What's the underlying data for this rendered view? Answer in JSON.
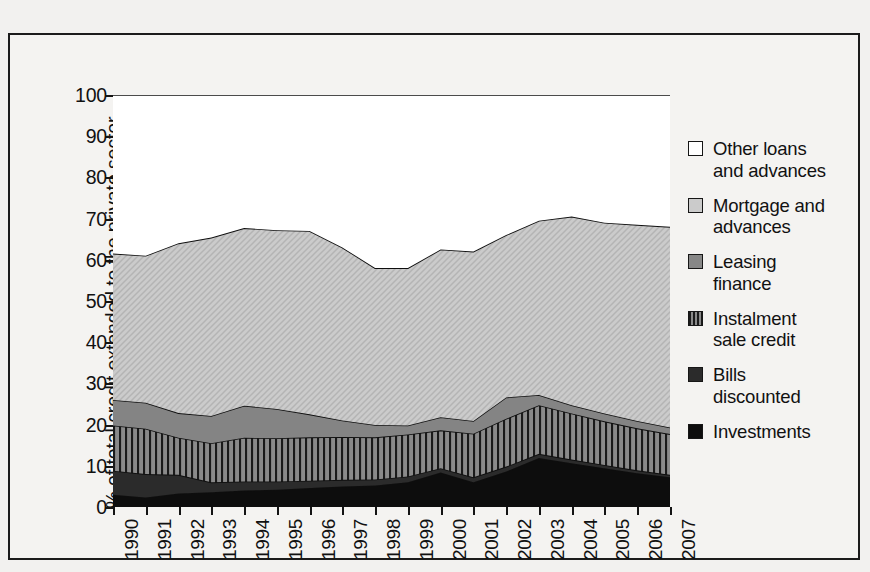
{
  "chart_data": {
    "type": "area",
    "stacked": true,
    "title": "",
    "xlabel": "",
    "ylabel": "% of total credit extended to the private sector",
    "ylim": [
      0,
      100
    ],
    "ytick_labels": [
      "0",
      "10",
      "20",
      "30",
      "40",
      "50",
      "60",
      "70",
      "80",
      "90",
      "100"
    ],
    "ytick_values": [
      0,
      10,
      20,
      30,
      40,
      50,
      60,
      70,
      80,
      90,
      100
    ],
    "grid": false,
    "legend_position": "right",
    "categories": [
      "1990",
      "1991",
      "1992",
      "1993",
      "1994",
      "1995",
      "1996",
      "1997",
      "1998",
      "1999",
      "2000",
      "2001",
      "2002",
      "2003",
      "2004",
      "2005",
      "2006",
      "2007"
    ],
    "x": [
      1990,
      1991,
      1992,
      1993,
      1994,
      1995,
      1996,
      1997,
      1998,
      1999,
      2000,
      2001,
      2002,
      2003,
      2004,
      2005,
      2006,
      2007
    ],
    "series": [
      {
        "name": "Investments",
        "fill": "#0d0d0d",
        "pattern": "solid",
        "values": [
          3.0,
          2.3,
          3.3,
          3.6,
          4.0,
          4.2,
          4.6,
          5.0,
          5.2,
          6.0,
          8.4,
          6.0,
          8.6,
          11.9,
          10.6,
          9.4,
          8.2,
          7.2
        ]
      },
      {
        "name": "Bills discounted",
        "fill": "#2b2b2b",
        "pattern": "solid",
        "values": [
          5.8,
          5.7,
          4.5,
          2.4,
          2.2,
          2.0,
          1.8,
          1.6,
          1.5,
          1.4,
          1.0,
          1.2,
          1.2,
          1.0,
          0.9,
          0.8,
          0.7,
          0.6
        ]
      },
      {
        "name": "Instalment sale credit",
        "fill": "#7f7f7f",
        "pattern": "vertical-lines",
        "values": [
          11.0,
          11.0,
          9.0,
          9.5,
          10.6,
          10.5,
          10.5,
          10.4,
          10.2,
          10.2,
          9.2,
          10.6,
          11.6,
          11.8,
          11.2,
          10.6,
          10.2,
          9.9
        ]
      },
      {
        "name": "Leasing finance",
        "fill": "#848484",
        "pattern": "solid",
        "values": [
          6.2,
          6.3,
          6.0,
          6.6,
          7.8,
          7.1,
          5.6,
          4.0,
          3.0,
          2.2,
          3.2,
          3.1,
          5.2,
          2.5,
          2.0,
          1.9,
          1.8,
          1.6
        ]
      },
      {
        "name": "Mortgage and advances",
        "fill": "#c9c9c9",
        "pattern": "diagonal",
        "values": [
          35.5,
          35.7,
          41.2,
          43.3,
          43.1,
          43.4,
          44.5,
          42.0,
          38.1,
          38.2,
          40.7,
          41.1,
          39.4,
          42.3,
          45.8,
          46.3,
          47.6,
          48.7
        ]
      },
      {
        "name": "Other loans and advances",
        "fill": "#ffffff",
        "pattern": "solid",
        "values": [
          38.5,
          39.0,
          36.0,
          34.6,
          32.3,
          32.8,
          33.0,
          37.0,
          42.0,
          42.0,
          37.5,
          38.0,
          34.0,
          30.5,
          29.5,
          31.0,
          31.5,
          32.0
        ]
      }
    ],
    "cumulative_tops": {
      "investments": [
        3.0,
        2.3,
        3.3,
        3.6,
        4.0,
        4.2,
        4.6,
        5.0,
        5.2,
        6.0,
        8.4,
        6.0,
        8.6,
        11.9,
        10.6,
        9.4,
        8.2,
        7.2
      ],
      "bills": [
        8.8,
        8.0,
        7.8,
        6.0,
        6.2,
        6.2,
        6.4,
        6.6,
        6.7,
        7.4,
        9.4,
        7.2,
        9.8,
        12.9,
        11.5,
        10.2,
        8.9,
        7.8
      ],
      "instalment": [
        19.8,
        19.0,
        16.8,
        15.5,
        16.8,
        16.7,
        16.9,
        17.0,
        16.9,
        17.6,
        18.6,
        17.8,
        21.4,
        24.7,
        22.7,
        20.8,
        19.1,
        17.7
      ],
      "leasing": [
        26.0,
        25.3,
        22.8,
        22.1,
        24.6,
        23.8,
        22.5,
        21.0,
        19.9,
        19.8,
        21.8,
        20.9,
        26.6,
        27.2,
        24.7,
        22.7,
        20.9,
        19.3
      ],
      "mortgage": [
        61.5,
        61.0,
        64.0,
        65.4,
        67.7,
        67.2,
        67.0,
        63.0,
        58.0,
        58.0,
        62.5,
        62.0,
        66.0,
        69.5,
        70.5,
        69.0,
        68.5,
        68.0
      ]
    }
  },
  "legend": {
    "items": [
      {
        "label_line1": "Other loans",
        "label_line2": "and advances",
        "swatch": "white-swatch"
      },
      {
        "label_line1": "Mortgage and",
        "label_line2": "advances",
        "swatch": "light-gray-swatch"
      },
      {
        "label_line1": "Leasing",
        "label_line2": "finance",
        "swatch": "mid-gray-swatch"
      },
      {
        "label_line1": "Instalment",
        "label_line2": "sale credit",
        "swatch": "hatched-swatch"
      },
      {
        "label_line1": "Bills",
        "label_line2": "discounted",
        "swatch": "dark-gray-swatch"
      },
      {
        "label_line1": "Investments",
        "label_line2": "",
        "swatch": "black-swatch"
      }
    ]
  }
}
